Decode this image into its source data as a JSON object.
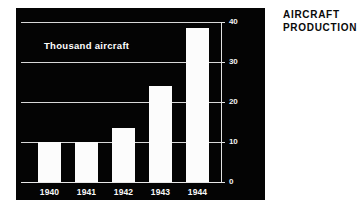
{
  "caption": {
    "line1": "AIRCRAFT",
    "line2": "PRODUCTION"
  },
  "panel": {
    "background_color": "#040404",
    "ink_color": "#ffffff",
    "inner_label": "Thousand aircraft"
  },
  "chart_data": {
    "type": "bar",
    "title": "AIRCRAFT PRODUCTION",
    "subtitle": "Thousand aircraft",
    "categories": [
      "1940",
      "1941",
      "1942",
      "1943",
      "1944"
    ],
    "values": [
      10,
      10,
      13.5,
      24,
      38.5
    ],
    "xlabel": "",
    "ylabel": "Thousand aircraft",
    "ylim": [
      0,
      40
    ],
    "yticks": [
      0,
      10,
      20,
      30,
      40
    ],
    "ytick_labels": [
      "0",
      "10",
      "20",
      "30",
      "40"
    ],
    "grid": true,
    "grid_axis": "y",
    "legend": false,
    "bar_color": "#fcfcfc",
    "background_color": "#040404"
  }
}
